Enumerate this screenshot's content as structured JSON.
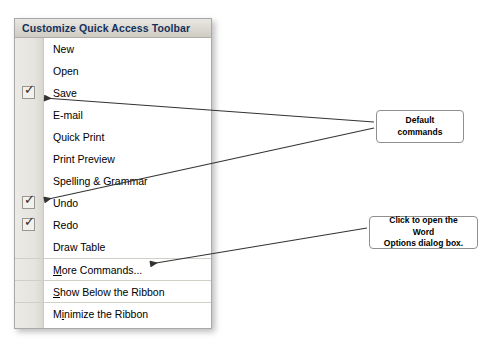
{
  "menu": {
    "header": "Customize Quick Access Toolbar",
    "items": [
      {
        "label": "New",
        "checked": false,
        "separator_above": false,
        "accel": ""
      },
      {
        "label": "Open",
        "checked": false,
        "separator_above": false,
        "accel": ""
      },
      {
        "label": "Save",
        "checked": true,
        "separator_above": false,
        "accel": ""
      },
      {
        "label": "E-mail",
        "checked": false,
        "separator_above": false,
        "accel": ""
      },
      {
        "label": "Quick Print",
        "checked": false,
        "separator_above": false,
        "accel": ""
      },
      {
        "label": "Print Preview",
        "checked": false,
        "separator_above": false,
        "accel": ""
      },
      {
        "label": "Spelling & Grammar",
        "checked": false,
        "separator_above": false,
        "accel": ""
      },
      {
        "label": "Undo",
        "checked": true,
        "separator_above": false,
        "accel": ""
      },
      {
        "label": "Redo",
        "checked": true,
        "separator_above": false,
        "accel": ""
      },
      {
        "label": "Draw Table",
        "checked": false,
        "separator_above": false,
        "accel": ""
      },
      {
        "label": "More Commands...",
        "checked": false,
        "separator_above": true,
        "accel": "M"
      },
      {
        "label": "Show Below the Ribbon",
        "checked": false,
        "separator_above": true,
        "accel": "S"
      },
      {
        "label": "Minimize the Ribbon",
        "checked": false,
        "separator_above": true,
        "accel": "i"
      }
    ],
    "checkmark_glyph": "✓"
  },
  "callouts": {
    "default_commands": {
      "line1": "Default",
      "line2": "commands"
    },
    "word_options": {
      "line1": "Click to open the Word",
      "line2": "Options dialog box."
    }
  },
  "colors": {
    "header_text": "#13315c",
    "panel_border": "#a8a8a8",
    "gutter": "#e6e4df",
    "leader_line": "#3a3a3a"
  }
}
